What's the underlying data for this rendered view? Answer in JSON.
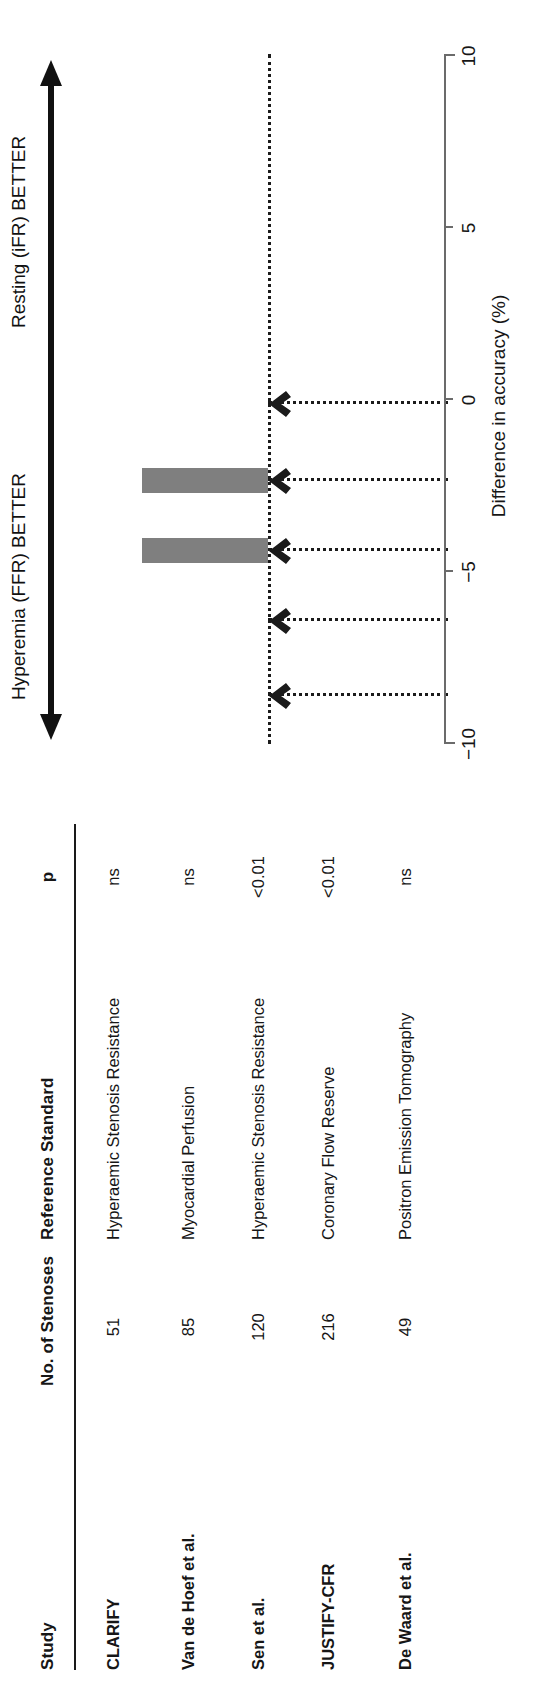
{
  "table": {
    "columns": [
      "Study",
      "No. of Stenoses",
      "Reference Standard",
      "p"
    ],
    "rows": [
      {
        "study": "CLARIFY",
        "stenoses": "51",
        "reference": "Hyperaemic Stenosis Resistance",
        "p": "ns"
      },
      {
        "study": "Van de Hoef et al.",
        "stenoses": "85",
        "reference": "Myocardial Perfusion",
        "p": "ns"
      },
      {
        "study": "Sen et al.",
        "stenoses": "120",
        "reference": "Hyperaemic Stenosis Resistance",
        "p": "<0.01"
      },
      {
        "study": "JUSTIFY-CFR",
        "stenoses": "216",
        "reference": "Coronary Flow Reserve",
        "p": "<0.01"
      },
      {
        "study": "De Waard et al.",
        "stenoses": "49",
        "reference": "Positron Emission Tomography",
        "p": "ns"
      }
    ]
  },
  "annotations": {
    "positive_direction_label": "Resting (iFR) BETTER",
    "negative_direction_label": "Hyperemia  (FFR) BETTER"
  },
  "colors": {
    "bar": "#7f7f7f",
    "axis": "#6b6b6b",
    "text": "#161616",
    "leader": "#1b1b1b"
  },
  "chart_data": {
    "type": "bar",
    "title": "",
    "xlabel": "Difference in accuracy (%)",
    "ylabel": "",
    "orientation": "horizontal",
    "categories": [
      "CLARIFY",
      "Van de Hoef et al.",
      "Sen et al.",
      "JUSTIFY-CFR",
      "De Waard et al."
    ],
    "values": [
      0,
      0,
      7,
      7,
      0
    ],
    "xlim": [
      -10,
      10
    ],
    "xticks": [
      -10,
      -5,
      0,
      5,
      10
    ],
    "xticklabels": [
      "−10",
      "−5",
      "0",
      "5",
      "10"
    ],
    "grid": false,
    "legend": false,
    "zero_reference": 0,
    "annotations": [
      "Resting (iFR) BETTER",
      "Hyperemia  (FFR) BETTER"
    ]
  }
}
